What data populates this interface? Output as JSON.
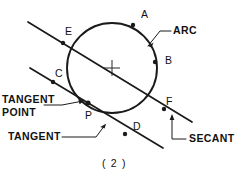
{
  "figure": {
    "caption": "( 2 )",
    "ink_color": "#1a1a1a",
    "background_color": "#ffffff",
    "point_labels": {
      "a": "A",
      "b": "B",
      "c": "C",
      "d": "D",
      "e": "E",
      "f": "F",
      "p": "P"
    },
    "term_labels": {
      "arc": "ARC",
      "secant": "SECANT",
      "tangent": "TANGENT",
      "tangent_point_line1": "TANGENT",
      "tangent_point_line2": "POINT"
    },
    "geometry": {
      "circle_center_x": 112,
      "circle_center_y": 68,
      "circle_radius": 45,
      "secant_start": "28,22",
      "secant_end": "192,122",
      "tangent_start": "30,68",
      "tangent_end": "163,148"
    }
  }
}
